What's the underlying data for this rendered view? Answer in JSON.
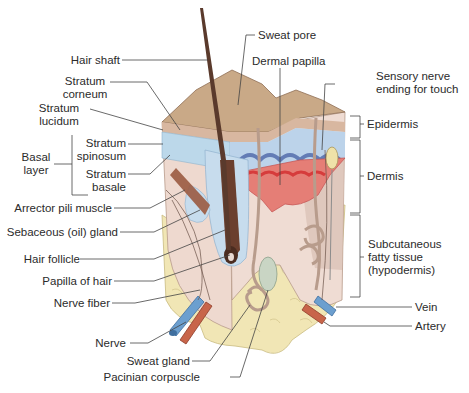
{
  "diagram": {
    "colors": {
      "epidermis_surface": "#c9a987",
      "stratum_layers": "#dcb79e",
      "basal_blue": "#bcd8ea",
      "dermis": "#eed9cf",
      "papilla_red": "#e06a6a",
      "fat": "#f1e6b5",
      "vein": "#6c9fcf",
      "artery": "#c8654a",
      "hair": "#5a3a2c",
      "leader_line": "#444444"
    },
    "labels": {
      "hair_shaft": "Hair shaft",
      "sweat_pore": "Sweat pore",
      "dermal_papilla": "Dermal papilla",
      "sensory_nerve_1": "Sensory nerve",
      "sensory_nerve_2": "ending for touch",
      "stratum_corneum_1": "Stratum",
      "stratum_corneum_2": "corneum",
      "stratum_lucidum_1": "Stratum",
      "stratum_lucidum_2": "lucidum",
      "basal_layer_1": "Basal",
      "basal_layer_2": "layer",
      "stratum_spinosum_1": "Stratum",
      "stratum_spinosum_2": "spinosum",
      "stratum_basale_1": "Stratum",
      "stratum_basale_2": "basale",
      "epidermis": "Epidermis",
      "dermis": "Dermis",
      "arrector_pili": "Arrector pili muscle",
      "sebaceous_gland": "Sebaceous (oil) gland",
      "hair_follicle": "Hair follicle",
      "papilla_of_hair": "Papilla of hair",
      "nerve_fiber": "Nerve fiber",
      "nerve": "Nerve",
      "sweat_gland": "Sweat gland",
      "pacinian": "Pacinian corpuscle",
      "subcutaneous_1": "Subcutaneous",
      "subcutaneous_2": "fatty tissue",
      "subcutaneous_3": "(hypodermis)",
      "vein": "Vein",
      "artery": "Artery"
    }
  }
}
